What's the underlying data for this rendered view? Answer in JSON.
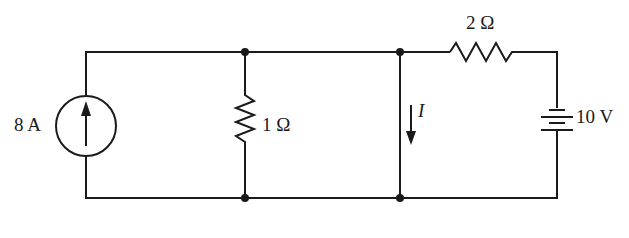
{
  "diagram": {
    "type": "circuit",
    "components": {
      "current_source": {
        "label": "8 A",
        "direction": "up"
      },
      "resistor_1": {
        "label": "1 Ω"
      },
      "resistor_2": {
        "label": "2 Ω"
      },
      "voltage_source": {
        "label": "10 V"
      },
      "current_indicator": {
        "label": "I",
        "direction": "down"
      }
    },
    "colors": {
      "ink": "#1a1a1a",
      "background": "#ffffff"
    }
  }
}
